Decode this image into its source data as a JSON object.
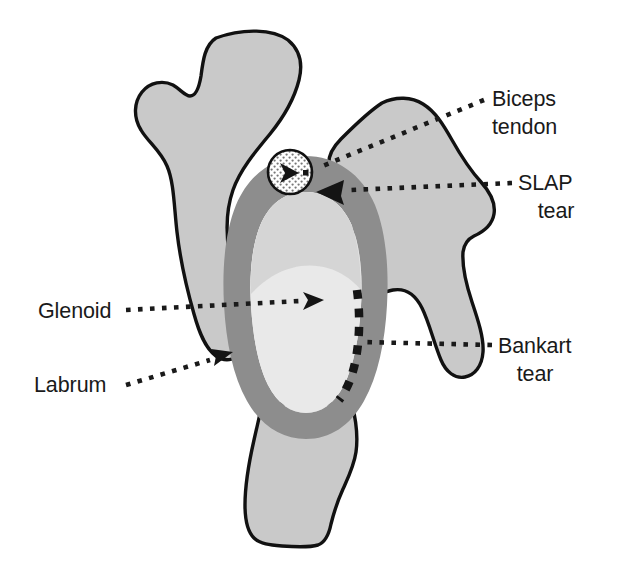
{
  "figure": {
    "view": "Lateral (en face) view of the right glenoid with labrum, biceps tendon anchor and tear locations",
    "background_color": "#ffffff"
  },
  "colors": {
    "bone_fill": "#c9c9c9",
    "labrum_fill": "#8d8d8d",
    "glenoid_fill": "#e9e9e9",
    "glenoid_mid_fill": "#d4d4d4",
    "outline": "#111111",
    "tear_color": "#151515",
    "leader_color": "#1a1a1a",
    "biceps_circle_fill": "#ffffff",
    "text_color": "#1a1a1a"
  },
  "labels": [
    {
      "id": "biceps-tendon",
      "lines": [
        "Biceps",
        "tendon"
      ],
      "line1": "Biceps",
      "line2": "tendon",
      "text_x": 492,
      "text_y": 106,
      "align": "start",
      "points_to": "stippled white circle at superior labrum (biceps anchor)",
      "leader": {
        "from_x": 484,
        "from_y": 100,
        "to_x": 305,
        "to_y": 172
      },
      "arrowhead": true
    },
    {
      "id": "slap-tear",
      "lines": [
        "SLAP",
        "tear"
      ],
      "line1": "SLAP",
      "line2": "tear",
      "text_x": 556,
      "text_y": 190,
      "align": "middle",
      "points_to": "superior labrum anterior to posterior tear at top of labral ring",
      "leader": {
        "from_x": 512,
        "from_y": 183,
        "to_x": 322,
        "to_y": 192
      },
      "arrowhead": true
    },
    {
      "id": "bankart-tear",
      "lines": [
        "Bankart",
        "tear"
      ],
      "line1": "Bankart",
      "line2": "tear",
      "text_x": 498,
      "text_y": 353,
      "align": "start",
      "points_to": "dashed detachment line along anterior-inferior labrum",
      "leader": {
        "from_x": 492,
        "from_y": 345,
        "to_x": 360,
        "to_y": 342
      },
      "arrowhead": false
    },
    {
      "id": "glenoid",
      "lines": [
        "Glenoid"
      ],
      "line1": "Glenoid",
      "line2": "",
      "text_x": 38,
      "text_y": 318,
      "align": "start",
      "points_to": "central light articular surface inside the labral ring",
      "leader": {
        "from_x": 126,
        "from_y": 310,
        "to_x": 316,
        "to_y": 300
      },
      "arrowhead": true
    },
    {
      "id": "labrum",
      "lines": [
        "Labrum"
      ],
      "line1": "Labrum",
      "line2": "",
      "text_x": 34,
      "text_y": 392,
      "align": "start",
      "points_to": "gray ring surrounding the glenoid",
      "leader": {
        "from_x": 126,
        "from_y": 385,
        "to_x": 226,
        "to_y": 355
      },
      "arrowhead": true
    }
  ],
  "structures": [
    {
      "id": "scapular-spine-acromion",
      "name": "Scapular spine and acromion",
      "fill": "#c9c9c9"
    },
    {
      "id": "coracoid-process",
      "name": "Coracoid process",
      "fill": "#c9c9c9"
    },
    {
      "id": "scapular-body-inferior",
      "name": "Inferior scapular body",
      "fill": "#c9c9c9"
    },
    {
      "id": "labrum-ring",
      "name": "Labrum",
      "fill": "#8d8d8d"
    },
    {
      "id": "glenoid-surface",
      "name": "Glenoid articular surface",
      "fill": "#e9e9e9"
    },
    {
      "id": "biceps-tendon-anchor",
      "name": "Biceps tendon anchor",
      "fill": "#ffffff"
    },
    {
      "id": "bankart-tear-line",
      "name": "Bankart tear",
      "fill": "#151515"
    },
    {
      "id": "slap-tear-arrow",
      "name": "SLAP tear indicator",
      "fill": "#141414"
    }
  ]
}
